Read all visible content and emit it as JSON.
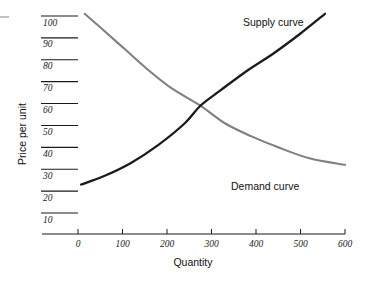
{
  "chart_data": {
    "type": "line",
    "title": "",
    "xlabel": "Quantity",
    "ylabel": "Price per unit",
    "xlim": [
      0,
      600
    ],
    "ylim": [
      0,
      105
    ],
    "grid": false,
    "legend_position": "inline-annotations",
    "x_ticks": [
      "0",
      "100",
      "200",
      "300",
      "400",
      "500",
      "600"
    ],
    "x_tick_values": [
      0,
      100,
      200,
      300,
      400,
      500,
      600
    ],
    "y_ticks": [
      "10",
      "20",
      "30",
      "40",
      "50",
      "60",
      "70",
      "80",
      "90",
      "100"
    ],
    "y_tick_values": [
      10,
      20,
      30,
      40,
      50,
      60,
      70,
      80,
      90,
      100
    ],
    "equilibrium": {
      "quantity": 275,
      "price": 59
    },
    "series": [
      {
        "name": "Supply curve",
        "color": "#1a1a1a",
        "label_text": "Supply curve",
        "points": [
          {
            "x": 7,
            "y": 23
          },
          {
            "x": 60,
            "y": 27
          },
          {
            "x": 120,
            "y": 33
          },
          {
            "x": 180,
            "y": 41
          },
          {
            "x": 240,
            "y": 51
          },
          {
            "x": 275,
            "y": 59
          },
          {
            "x": 320,
            "y": 66
          },
          {
            "x": 380,
            "y": 75
          },
          {
            "x": 440,
            "y": 83
          },
          {
            "x": 500,
            "y": 92
          },
          {
            "x": 555,
            "y": 101
          }
        ]
      },
      {
        "name": "Demand curve",
        "color": "#808080",
        "label_text": "Demand curve",
        "points": [
          {
            "x": 15,
            "y": 101
          },
          {
            "x": 60,
            "y": 93
          },
          {
            "x": 110,
            "y": 84
          },
          {
            "x": 160,
            "y": 75
          },
          {
            "x": 210,
            "y": 67
          },
          {
            "x": 275,
            "y": 59
          },
          {
            "x": 330,
            "y": 51
          },
          {
            "x": 390,
            "y": 45
          },
          {
            "x": 450,
            "y": 40
          },
          {
            "x": 520,
            "y": 35
          },
          {
            "x": 600,
            "y": 32
          }
        ]
      }
    ]
  },
  "labels": {
    "supply_curve": "Supply curve",
    "demand_curve": "Demand curve",
    "x_axis_title": "Quantity",
    "y_axis_title": "Price per unit"
  },
  "colors": {
    "supply": "#1a1a1a",
    "demand": "#808080",
    "axis": "#1a1a1a",
    "background": "#ffffff"
  }
}
